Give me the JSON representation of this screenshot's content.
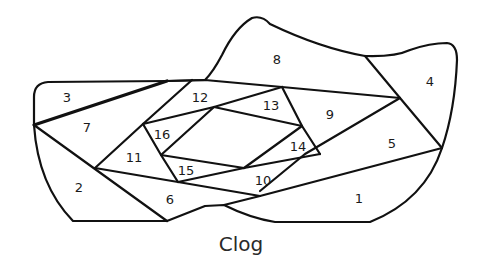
{
  "figure": {
    "caption": "Clog",
    "stroke_color": "#111111",
    "background": "#ffffff",
    "regions": [
      {
        "id": "1",
        "label": "1",
        "x": 359,
        "y": 198
      },
      {
        "id": "2",
        "label": "2",
        "x": 79,
        "y": 187
      },
      {
        "id": "3",
        "label": "3",
        "x": 67,
        "y": 97
      },
      {
        "id": "4",
        "label": "4",
        "x": 430,
        "y": 81
      },
      {
        "id": "5",
        "label": "5",
        "x": 392,
        "y": 143
      },
      {
        "id": "6",
        "label": "6",
        "x": 170,
        "y": 199
      },
      {
        "id": "7",
        "label": "7",
        "x": 87,
        "y": 127
      },
      {
        "id": "8",
        "label": "8",
        "x": 277,
        "y": 59
      },
      {
        "id": "9",
        "label": "9",
        "x": 330,
        "y": 114
      },
      {
        "id": "10",
        "label": "10",
        "x": 263,
        "y": 180
      },
      {
        "id": "11",
        "label": "11",
        "x": 134,
        "y": 157
      },
      {
        "id": "12",
        "label": "12",
        "x": 200,
        "y": 97
      },
      {
        "id": "13",
        "label": "13",
        "x": 271,
        "y": 105
      },
      {
        "id": "14",
        "label": "14",
        "x": 298,
        "y": 146
      },
      {
        "id": "15",
        "label": "15",
        "x": 186,
        "y": 170
      },
      {
        "id": "16",
        "label": "16",
        "x": 162,
        "y": 134
      }
    ]
  }
}
